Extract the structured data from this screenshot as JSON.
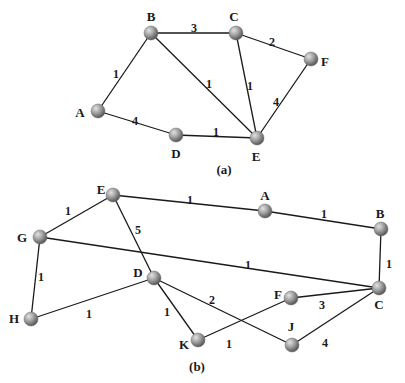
{
  "graphs": [
    {
      "id": "a",
      "caption": "(a)",
      "nodes": [
        {
          "name": "A",
          "label": "A"
        },
        {
          "name": "B",
          "label": "B"
        },
        {
          "name": "C",
          "label": "C"
        },
        {
          "name": "D",
          "label": "D"
        },
        {
          "name": "E",
          "label": "E"
        },
        {
          "name": "F",
          "label": "F"
        }
      ],
      "edges": [
        {
          "from": "A",
          "to": "B",
          "weight": "1"
        },
        {
          "from": "B",
          "to": "C",
          "weight": "3"
        },
        {
          "from": "C",
          "to": "F",
          "weight": "2"
        },
        {
          "from": "B",
          "to": "E",
          "weight": "1"
        },
        {
          "from": "C",
          "to": "E",
          "weight": "1"
        },
        {
          "from": "F",
          "to": "E",
          "weight": "4"
        },
        {
          "from": "A",
          "to": "D",
          "weight": "4"
        },
        {
          "from": "D",
          "to": "E",
          "weight": "1"
        }
      ]
    },
    {
      "id": "b",
      "caption": "(b)",
      "nodes": [
        {
          "name": "E",
          "label": "E"
        },
        {
          "name": "A",
          "label": "A"
        },
        {
          "name": "B",
          "label": "B"
        },
        {
          "name": "G",
          "label": "G"
        },
        {
          "name": "D",
          "label": "D"
        },
        {
          "name": "C",
          "label": "C"
        },
        {
          "name": "F",
          "label": "F"
        },
        {
          "name": "H",
          "label": "H"
        },
        {
          "name": "K",
          "label": "K"
        },
        {
          "name": "J",
          "label": "J"
        }
      ],
      "edges": [
        {
          "from": "G",
          "to": "E",
          "weight": "1"
        },
        {
          "from": "E",
          "to": "A",
          "weight": "1"
        },
        {
          "from": "A",
          "to": "B",
          "weight": "1"
        },
        {
          "from": "E",
          "to": "D",
          "weight": "5"
        },
        {
          "from": "G",
          "to": "C",
          "weight": "1"
        },
        {
          "from": "B",
          "to": "C",
          "weight": "1"
        },
        {
          "from": "G",
          "to": "H",
          "weight": "1"
        },
        {
          "from": "H",
          "to": "D",
          "weight": "1"
        },
        {
          "from": "D",
          "to": "K",
          "weight": "1"
        },
        {
          "from": "D",
          "to": "J",
          "weight": "2"
        },
        {
          "from": "K",
          "to": "F",
          "weight": "1"
        },
        {
          "from": "F",
          "to": "C",
          "weight": "3"
        },
        {
          "from": "J",
          "to": "C",
          "weight": "4"
        }
      ]
    }
  ]
}
